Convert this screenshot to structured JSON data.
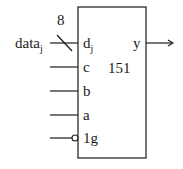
{
  "component": {
    "name": "151",
    "bus_width": "8",
    "external_input": "data",
    "external_input_sub": "j",
    "output": "y",
    "inputs": [
      {
        "label": "d",
        "sub": "j",
        "bus": true
      },
      {
        "label": "c"
      },
      {
        "label": "b"
      },
      {
        "label": "a"
      },
      {
        "label": "1g",
        "inverted": true
      }
    ]
  },
  "colors": {
    "line": "#1a1a1a",
    "background": "#ffffff"
  }
}
